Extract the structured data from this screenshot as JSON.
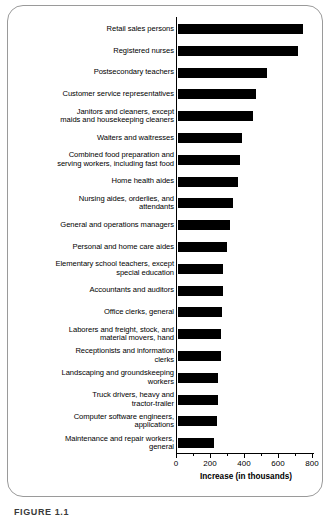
{
  "figure": {
    "caption": "FIGURE 1.1"
  },
  "chart_data": {
    "type": "bar",
    "orientation": "horizontal",
    "title": "",
    "xlabel": "Increase (in thousands)",
    "ylabel": "",
    "xlim": [
      0,
      800
    ],
    "xticks": [
      0,
      200,
      400,
      600,
      800
    ],
    "xtick_labels": [
      "0",
      "200",
      "400",
      "600",
      "800"
    ],
    "minor_tick_interval": 100,
    "grid": false,
    "legend": false,
    "bar_color": "#000000",
    "categories": [
      "Retail sales persons",
      "Registered nurses",
      "Postsecondary teachers",
      "Customer service representatives",
      "Janitors and cleaners, except\nmaids and housekeeping cleaners",
      "Waiters and waitresses",
      "Combined food preparation and\nserving workers, including fast food",
      "Home health aides",
      "Nursing aides, orderlies, and\nattendants",
      "General and operations managers",
      "Personal and home care aides",
      "Elementary school teachers, except\nspecial education",
      "Accountants and auditors",
      "Office clerks, general",
      "Laborers and freight, stock, and\nmaterial movers, hand",
      "Receptionists and information\nclerks",
      "Landscaping and groundskeeping\nworkers",
      "Truck drivers, heavy and\ntractor-trailer",
      "Computer software engineers,\napplications",
      "Maintenance and repair workers,\ngeneral"
    ],
    "values": [
      736,
      703,
      524,
      460,
      440,
      376,
      367,
      350,
      325,
      308,
      287,
      265,
      264,
      256,
      251,
      250,
      238,
      233,
      230,
      211
    ]
  }
}
